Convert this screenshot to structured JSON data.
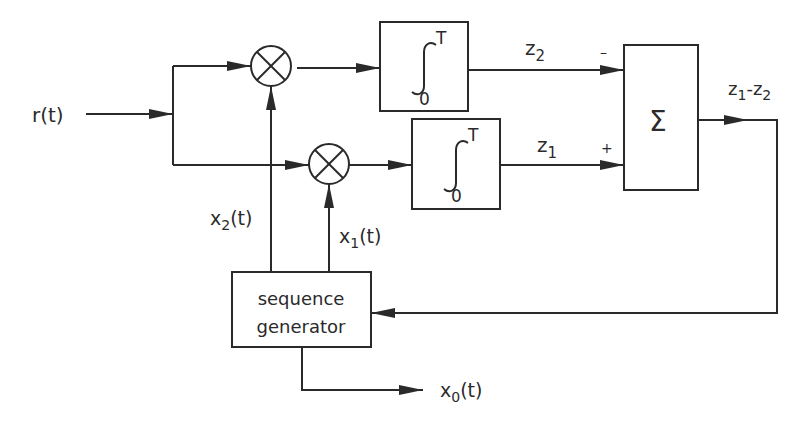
{
  "diagram": {
    "input_label": "r(t)",
    "integrator_top": {
      "upper_limit": "T",
      "lower_limit": "0",
      "output_label_base": "z",
      "output_label_sub": "2"
    },
    "integrator_bottom": {
      "upper_limit": "T",
      "lower_limit": "0",
      "output_label_base": "z",
      "output_label_sub": "1"
    },
    "summer": {
      "symbol": "Σ",
      "top_sign": "–",
      "bottom_sign": "+"
    },
    "output": {
      "z1": "z",
      "z1_sub": "1",
      "dash": "-",
      "z2": "z",
      "z2_sub": "2"
    },
    "x2": {
      "base": "x",
      "sub": "2",
      "suffix": "(t)"
    },
    "x1": {
      "base": "x",
      "sub": "1",
      "suffix": "(t)"
    },
    "x0": {
      "base": "x",
      "sub": "0",
      "suffix": "(t)"
    },
    "sequence_generator": {
      "line1": "sequence",
      "line2": "generator"
    },
    "multiplier_symbol": "⊗",
    "line_color": "#2a2a2a"
  }
}
